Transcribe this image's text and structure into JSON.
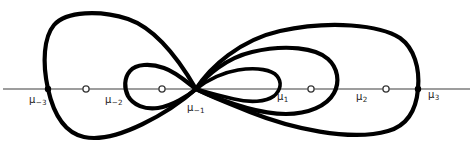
{
  "figure": {
    "width": 473,
    "height": 147,
    "background_color": "#ffffff",
    "axis": {
      "name": "real-axis",
      "color": "#7c7c7c",
      "y": 89,
      "x_start": 0,
      "x_end": 473
    },
    "curve_color": "#000000",
    "points": [
      {
        "id": "mu-minus-3",
        "label": "μ",
        "subscript": "−3",
        "x": 48,
        "y": 89,
        "marker": "filled",
        "label_x": 29,
        "label_y": 95
      },
      {
        "id": "open-node-left-outer",
        "label": "",
        "subscript": "",
        "x": 86,
        "y": 89,
        "marker": "open",
        "label_x": 0,
        "label_y": 0
      },
      {
        "id": "mu-minus-2",
        "label": "μ",
        "subscript": "−2",
        "x": 128,
        "y": 89,
        "marker": "none",
        "label_x": 105,
        "label_y": 95
      },
      {
        "id": "open-node-left-inner",
        "label": "",
        "subscript": "",
        "x": 162,
        "y": 89,
        "marker": "open",
        "label_x": 0,
        "label_y": 0
      },
      {
        "id": "mu-minus-1",
        "label": "μ",
        "subscript": "−1",
        "x": 196,
        "y": 89,
        "marker": "none",
        "label_x": 187,
        "label_y": 103
      },
      {
        "id": "mu-1",
        "label": "μ",
        "subscript": "1",
        "x": 277,
        "y": 89,
        "marker": "none",
        "label_x": 277,
        "label_y": 92
      },
      {
        "id": "open-node-right-inner",
        "label": "",
        "subscript": "",
        "x": 311,
        "y": 89,
        "marker": "open",
        "label_x": 0,
        "label_y": 0
      },
      {
        "id": "mu-2",
        "label": "μ",
        "subscript": "2",
        "x": 349,
        "y": 89,
        "marker": "none",
        "label_x": 356,
        "label_y": 92
      },
      {
        "id": "open-node-right-outer",
        "label": "",
        "subscript": "",
        "x": 386,
        "y": 89,
        "marker": "open",
        "label_x": 0,
        "label_y": 0
      },
      {
        "id": "mu-3",
        "label": "μ",
        "subscript": "3",
        "x": 418,
        "y": 89,
        "marker": "filled",
        "label_x": 428,
        "label_y": 90
      }
    ],
    "loops": [
      {
        "id": "left-outer-loop",
        "side": "left",
        "apex_x": 48,
        "top_y": 12,
        "bottom_y": 136,
        "path": "M 196 89 C 185 70 160 30 128 19 C 100 10 66 11 54 25 C 44 37 42 62 48 89 C 54 116 66 133 84 137 C 116 144 170 112 196 89 Z"
      },
      {
        "id": "left-inner-loop",
        "side": "left",
        "apex_x": 128,
        "top_y": 66,
        "bottom_y": 112,
        "path": "M 196 89 C 188 83 176 72 164 68 C 150 63 136 64 130 71 C 124 78 124 88 128 96 C 133 105 145 110 158 108 C 172 106 188 96 196 89 Z"
      },
      {
        "id": "right-outer-loop",
        "side": "right",
        "apex_x": 418,
        "top_y": 27,
        "bottom_y": 133,
        "path": "M 196 89 C 210 67 240 40 280 31 C 330 20 380 25 400 38 C 414 48 420 68 418 89 C 416 112 406 126 388 131 C 350 142 290 128 250 112 C 222 101 205 94 196 89 Z"
      },
      {
        "id": "right-middle-loop",
        "side": "right",
        "apex_x": 332,
        "top_y": 50,
        "bottom_y": 119,
        "path": "M 196 89 C 206 76 226 58 252 52 C 286 44 316 48 328 59 C 338 68 340 82 334 93 C 327 106 308 114 286 114 C 255 114 218 99 196 89 Z"
      },
      {
        "id": "right-inner-loop",
        "side": "right",
        "apex_x": 277,
        "top_y": 69,
        "bottom_y": 104,
        "path": "M 196 89 C 205 82 220 73 238 70 C 258 67 272 70 277 76 C 282 82 281 90 274 96 C 266 102 250 103 234 99 C 216 95 203 91 196 89 Z"
      }
    ]
  }
}
